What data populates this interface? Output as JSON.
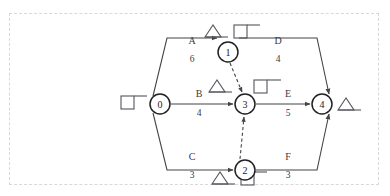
{
  "diagram": {
    "type": "activity-on-arrow-network",
    "frame": {
      "style": "dashed",
      "color": "#d8d8dc"
    },
    "colors": {
      "line": "#444449",
      "node_stroke": "#222226",
      "node_fill": "#ffffff",
      "text": "#3a3a40",
      "glyph": "#55555c"
    },
    "nodes": [
      {
        "id": "n0",
        "label": "0",
        "x": 160,
        "y": 104,
        "r": 10
      },
      {
        "id": "n1",
        "label": "1",
        "x": 228,
        "y": 52,
        "r": 10
      },
      {
        "id": "n2",
        "label": "2",
        "x": 245,
        "y": 156,
        "r": 10
      },
      {
        "id": "n3",
        "label": "3",
        "x": 245,
        "y": 104,
        "r": 10
      },
      {
        "id": "n4",
        "label": "4",
        "x": 322,
        "y": 104,
        "r": 10
      }
    ],
    "edges": [
      {
        "id": "eA",
        "label": "A",
        "value": "6",
        "from": "0",
        "to": "1",
        "style": "solid",
        "label_x": 192,
        "label_y": 44,
        "value_x": 192,
        "value_y": 62
      },
      {
        "id": "eD",
        "label": "D",
        "value": "4",
        "from": "1",
        "to": "4",
        "style": "solid",
        "label_x": 278,
        "label_y": 44,
        "value_x": 278,
        "value_y": 62
      },
      {
        "id": "eB",
        "label": "B",
        "value": "4",
        "from": "0",
        "to": "3",
        "style": "solid",
        "label_x": 199,
        "label_y": 97,
        "value_x": 199,
        "value_y": 115
      },
      {
        "id": "eE",
        "label": "E",
        "value": "5",
        "from": "3",
        "to": "4",
        "style": "solid",
        "label_x": 288,
        "label_y": 97,
        "value_x": 288,
        "value_y": 115
      },
      {
        "id": "eC",
        "label": "C",
        "value": "3",
        "from": "0",
        "to": "2",
        "style": "solid",
        "label_x": 192,
        "label_y": 148,
        "value_x": 192,
        "value_y": 166
      },
      {
        "id": "eF",
        "label": "F",
        "value": "3",
        "from": "2",
        "to": "4",
        "style": "solid",
        "label_x": 288,
        "label_y": 148,
        "value_x": 288,
        "value_y": 166
      },
      {
        "id": "eDummy1",
        "label": "",
        "value": "",
        "from": "1",
        "to": "3",
        "style": "dashed"
      },
      {
        "id": "eDummy2",
        "label": "",
        "value": "",
        "from": "2",
        "to": "3",
        "style": "dashed"
      }
    ],
    "annotations": [
      {
        "id": "a1",
        "glyph": "square-with-tail",
        "x": 129,
        "y": 104,
        "near": "0"
      },
      {
        "id": "a2",
        "glyph": "triangle-with-base",
        "x": 213,
        "y": 31,
        "near": "1"
      },
      {
        "id": "a3",
        "glyph": "square-with-tail",
        "x": 243,
        "y": 31,
        "near": "1"
      },
      {
        "id": "a4",
        "glyph": "triangle-with-base",
        "x": 219,
        "y": 92,
        "near": "3"
      },
      {
        "id": "a5",
        "glyph": "square-with-tail",
        "x": 262,
        "y": 92,
        "near": "3"
      },
      {
        "id": "a6",
        "glyph": "triangle-with-base",
        "x": 347,
        "y": 104,
        "near": "4"
      },
      {
        "id": "a7",
        "glyph": "triangle-with-base",
        "x": 220,
        "y": 178,
        "near": "2"
      },
      {
        "id": "a8",
        "glyph": "square-with-tail",
        "x": 250,
        "y": 178,
        "near": "2"
      }
    ]
  }
}
